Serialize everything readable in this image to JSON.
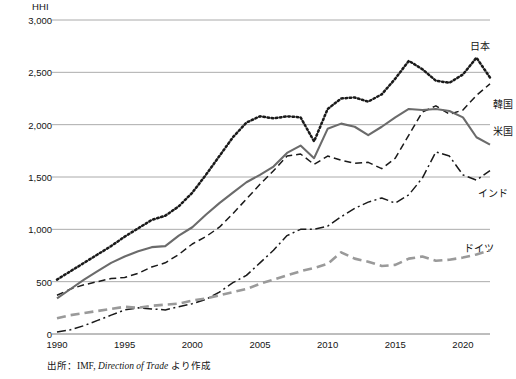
{
  "chart_data": {
    "type": "line",
    "title": "",
    "axis_title": "HHI",
    "xlabel": "",
    "ylabel": "HHI",
    "xlim": [
      1990,
      2022
    ],
    "ylim": [
      0,
      3000
    ],
    "yticks": [
      "0",
      "500",
      "1,000",
      "1,500",
      "2,000",
      "2,500",
      "3,000"
    ],
    "ytick_values": [
      0,
      500,
      1000,
      1500,
      2000,
      2500,
      3000
    ],
    "xticks": [
      "1990",
      "1995",
      "2000",
      "2005",
      "2010",
      "2015",
      "2020"
    ],
    "xtick_values": [
      1990,
      1995,
      2000,
      2005,
      2010,
      2015,
      2020
    ],
    "grid": "horizontal",
    "legend_position": "right-inline",
    "x": [
      1990,
      1991,
      1992,
      1993,
      1994,
      1995,
      1996,
      1997,
      1998,
      1999,
      2000,
      2001,
      2002,
      2003,
      2004,
      2005,
      2006,
      2007,
      2008,
      2009,
      2010,
      2011,
      2012,
      2013,
      2014,
      2015,
      2016,
      2017,
      2018,
      2019,
      2020,
      2021,
      2022
    ],
    "series": [
      {
        "name": "日本",
        "label": "日本",
        "style": "dotted",
        "color": "#1a1a1a",
        "values": [
          520,
          600,
          680,
          760,
          840,
          930,
          1010,
          1090,
          1130,
          1220,
          1350,
          1520,
          1700,
          1880,
          2020,
          2080,
          2060,
          2080,
          2070,
          1840,
          2150,
          2250,
          2260,
          2220,
          2290,
          2440,
          2610,
          2530,
          2420,
          2400,
          2480,
          2640,
          2450
        ]
      },
      {
        "name": "韓国",
        "label": "韓国",
        "style": "dashed",
        "color": "#1a1a1a",
        "values": [
          370,
          430,
          470,
          500,
          530,
          540,
          580,
          640,
          680,
          760,
          860,
          930,
          1020,
          1150,
          1290,
          1430,
          1560,
          1700,
          1720,
          1620,
          1700,
          1660,
          1630,
          1640,
          1580,
          1680,
          1900,
          2120,
          2180,
          2100,
          2140,
          2280,
          2390
        ]
      },
      {
        "name": "米国",
        "label": "米国",
        "style": "solid",
        "color": "#6b6b6b",
        "values": [
          340,
          430,
          520,
          600,
          680,
          740,
          790,
          830,
          840,
          940,
          1020,
          1140,
          1250,
          1350,
          1450,
          1520,
          1600,
          1730,
          1800,
          1680,
          1960,
          2010,
          1980,
          1900,
          1980,
          2070,
          2150,
          2140,
          2150,
          2130,
          2070,
          1880,
          1810
        ]
      },
      {
        "name": "インド",
        "label": "インド",
        "style": "dashdot",
        "color": "#1a1a1a",
        "values": [
          20,
          40,
          80,
          130,
          180,
          230,
          250,
          240,
          230,
          260,
          290,
          330,
          400,
          490,
          560,
          680,
          800,
          940,
          1000,
          1000,
          1030,
          1120,
          1200,
          1260,
          1300,
          1250,
          1330,
          1490,
          1740,
          1700,
          1520,
          1470,
          1560
        ]
      },
      {
        "name": "ドイツ",
        "label": "ドイツ",
        "style": "longdash",
        "color": "#9a9a9a",
        "values": [
          150,
          180,
          200,
          220,
          240,
          260,
          250,
          270,
          280,
          290,
          320,
          340,
          370,
          400,
          430,
          480,
          520,
          560,
          600,
          630,
          670,
          780,
          720,
          690,
          650,
          660,
          720,
          740,
          700,
          710,
          730,
          760,
          800
        ]
      }
    ],
    "source_note": {
      "prefix": "出所：IMF, ",
      "italic": "Direction of Trade",
      "suffix": " より作成"
    }
  }
}
